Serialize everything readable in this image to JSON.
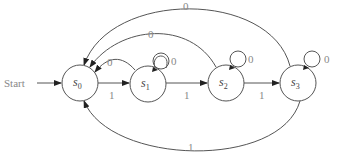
{
  "diagram": {
    "type": "finite-state-machine",
    "start_label": "Start",
    "states": [
      {
        "id": "s0",
        "label": "s",
        "sub": "0"
      },
      {
        "id": "s1",
        "label": "s",
        "sub": "1"
      },
      {
        "id": "s2",
        "label": "s",
        "sub": "2"
      },
      {
        "id": "s3",
        "label": "s",
        "sub": "3"
      }
    ],
    "transitions": [
      {
        "from": "start",
        "to": "s0",
        "label": ""
      },
      {
        "from": "s0",
        "to": "s1",
        "label": "1"
      },
      {
        "from": "s1",
        "to": "s0",
        "label": "0"
      },
      {
        "from": "s1",
        "to": "s1",
        "label": "0"
      },
      {
        "from": "s1",
        "to": "s2",
        "label": "1"
      },
      {
        "from": "s2",
        "to": "s2",
        "label": "0"
      },
      {
        "from": "s2",
        "to": "s0",
        "label": "0"
      },
      {
        "from": "s2",
        "to": "s3",
        "label": "1"
      },
      {
        "from": "s3",
        "to": "s3",
        "label": "0"
      },
      {
        "from": "s3",
        "to": "s0",
        "label": "0"
      },
      {
        "from": "s3",
        "to": "s0",
        "label": "1"
      }
    ]
  }
}
